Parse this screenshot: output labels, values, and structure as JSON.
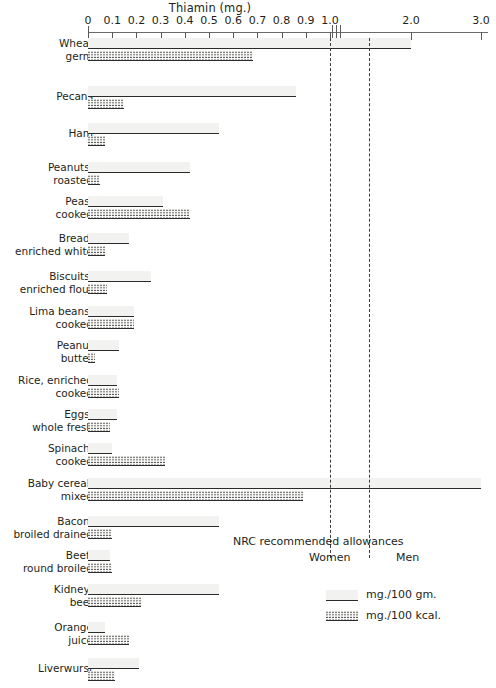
{
  "chart_data": {
    "type": "bar",
    "title": "Thiamin (mg.)",
    "xlabel": "",
    "ylabel": "",
    "orientation": "horizontal",
    "grid": false,
    "legend_position": "bottom-right",
    "axis": {
      "ticks": [
        0,
        0.1,
        0.2,
        0.3,
        0.4,
        0.5,
        0.6,
        0.7,
        0.8,
        0.9,
        1.0,
        2.0,
        3.0
      ],
      "tick_labels": [
        "0",
        "0.1",
        "0.2",
        "0.3",
        "0.4",
        "0.5",
        "0.6",
        "0.7",
        "0.8",
        "0.9",
        "1.0",
        "2.0",
        "3.0"
      ],
      "xlim": [
        0,
        3.0
      ],
      "axis_break_after": 1.0,
      "note": "axis is compressed after 1.0 (scale break)"
    },
    "series": [
      {
        "name": "mg./100 gm.",
        "pattern": "speckled"
      },
      {
        "name": "mg./100 kcal.",
        "pattern": "dotted"
      }
    ],
    "categories": [
      "Wheat germ",
      "Pecans",
      "Ham",
      "Peanuts, roasted",
      "Peas, cooked",
      "Bread, enriched white",
      "Biscuits, enriched flour",
      "Lima beans, cooked",
      "Peanut butter",
      "Rice, enriched cooked",
      "Eggs, whole fresh",
      "Spinach, cooked",
      "Baby cereal, mixed",
      "Bacon, broiled drained",
      "Beef, round broiled",
      "Kidney, beef",
      "Orange juice",
      "Liverwurst"
    ],
    "values_mg_per_100gm": [
      2.0,
      0.86,
      0.54,
      0.42,
      0.31,
      0.17,
      0.26,
      0.19,
      0.13,
      0.12,
      0.12,
      0.1,
      3.0,
      0.54,
      0.09,
      0.54,
      0.07,
      0.21
    ],
    "values_mg_per_100kcal": [
      0.68,
      0.15,
      0.07,
      0.05,
      0.42,
      0.07,
      0.08,
      0.19,
      0.03,
      0.13,
      0.09,
      0.32,
      0.89,
      0.1,
      0.1,
      0.22,
      0.17,
      0.11
    ],
    "reference_lines": [
      {
        "label": "Women",
        "value": 1.0
      },
      {
        "label": "Men",
        "value": 1.4
      }
    ],
    "annotations": [
      "NRC recommended allowances"
    ]
  },
  "rows": [
    {
      "label_lines": [
        "Wheat",
        "germ"
      ],
      "gm": 2.0,
      "kcal": 0.68
    },
    {
      "label_lines": [
        "Pecans"
      ],
      "gm": 0.86,
      "kcal": 0.15
    },
    {
      "label_lines": [
        "Ham"
      ],
      "gm": 0.54,
      "kcal": 0.07
    },
    {
      "label_lines": [
        "Peanuts,",
        "roasted"
      ],
      "gm": 0.42,
      "kcal": 0.05
    },
    {
      "label_lines": [
        "Peas,",
        "cooked"
      ],
      "gm": 0.31,
      "kcal": 0.42
    },
    {
      "label_lines": [
        "Bread,",
        "enriched white"
      ],
      "gm": 0.17,
      "kcal": 0.07
    },
    {
      "label_lines": [
        "Biscuits,",
        "enriched flour"
      ],
      "gm": 0.26,
      "kcal": 0.08
    },
    {
      "label_lines": [
        "Lima beans,",
        "cooked"
      ],
      "gm": 0.19,
      "kcal": 0.19
    },
    {
      "label_lines": [
        "Peanut",
        "butter"
      ],
      "gm": 0.13,
      "kcal": 0.03
    },
    {
      "label_lines": [
        "Rice, enriched",
        "cooked"
      ],
      "gm": 0.12,
      "kcal": 0.13
    },
    {
      "label_lines": [
        "Eggs,",
        "whole fresh"
      ],
      "gm": 0.12,
      "kcal": 0.09
    },
    {
      "label_lines": [
        "Spinach,",
        "cooked"
      ],
      "gm": 0.1,
      "kcal": 0.32
    },
    {
      "label_lines": [
        "Baby cereal,",
        "mixed"
      ],
      "gm": 3.0,
      "kcal": 0.89
    },
    {
      "label_lines": [
        "Bacon,",
        "broiled drained"
      ],
      "gm": 0.54,
      "kcal": 0.1
    },
    {
      "label_lines": [
        "Beef,",
        "round broiled"
      ],
      "gm": 0.09,
      "kcal": 0.1
    },
    {
      "label_lines": [
        "Kidney,",
        "beef"
      ],
      "gm": 0.54,
      "kcal": 0.22
    },
    {
      "label_lines": [
        "Orange",
        "juice"
      ],
      "gm": 0.07,
      "kcal": 0.17
    },
    {
      "label_lines": [
        "Liverwurst"
      ],
      "gm": 0.21,
      "kcal": 0.11
    }
  ],
  "nrc": {
    "title": "NRC recommended allowances",
    "women": "Women",
    "men": "Men"
  },
  "legend": {
    "items": [
      {
        "label": "mg./100 gm.",
        "pattern": "speckled"
      },
      {
        "label": "mg./100 kcal.",
        "pattern": "dotted"
      }
    ]
  },
  "colors": {
    "ink": "#231f20",
    "axis": "#5a5a5a",
    "bar_edge": "#2b2b2b",
    "background": "#ffffff"
  }
}
